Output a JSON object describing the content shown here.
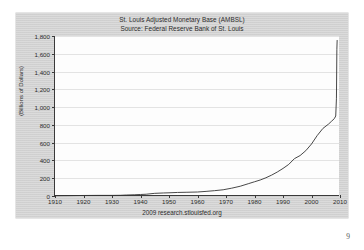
{
  "page": {
    "page_number": "9",
    "footer_note": "2009 research.stlouisfed.org"
  },
  "figure": {
    "title_line_1": "St. Louis Adjusted Monetary Base (AMBSL)",
    "title_line_2": "Source: Federal Reserve Bank of St. Louis",
    "y_axis_title": "(Billions of Dollars)",
    "line_color": "#333333",
    "grid_color": "#e3e3e3",
    "axis_color": "#3a3a3a",
    "card_color": "#d6d6d6",
    "plot_bg": "#fdfdfd"
  },
  "chart_data": {
    "type": "line",
    "title": "St. Louis Adjusted Monetary Base (AMBSL)",
    "subtitle": "Source: Federal Reserve Bank of St. Louis",
    "xlabel": "",
    "ylabel": "(Billions of Dollars)",
    "xlim": [
      1910,
      2010
    ],
    "ylim": [
      0,
      1800
    ],
    "xticks": [
      1910,
      1920,
      1930,
      1940,
      1950,
      1960,
      1970,
      1980,
      1990,
      2000,
      2010
    ],
    "yticks": [
      0,
      200,
      400,
      600,
      800,
      1000,
      1200,
      1400,
      1600,
      1800
    ],
    "ytick_labels": [
      "0",
      "200",
      "400",
      "600",
      "800",
      "1,000",
      "1,200",
      "1,400",
      "1,600",
      "1,800"
    ],
    "xtick_labels": [
      "1910",
      "1920",
      "1930",
      "1940",
      "1950",
      "1960",
      "1970",
      "1980",
      "1990",
      "2000",
      "2010"
    ],
    "grid": true,
    "legend": false,
    "series": [
      {
        "name": "AMBSL",
        "x": [
          1910,
          1915,
          1920,
          1925,
          1930,
          1933,
          1935,
          1938,
          1940,
          1942,
          1945,
          1948,
          1950,
          1953,
          1956,
          1960,
          1963,
          1966,
          1969,
          1972,
          1975,
          1978,
          1980,
          1982,
          1984,
          1986,
          1988,
          1990,
          1992,
          1994,
          1996,
          1998,
          2000,
          2002,
          2004,
          2006,
          2007,
          2008.0,
          2008.5,
          2008.75,
          2008.9,
          2009.0
        ],
        "y": [
          3,
          4,
          6,
          7,
          7,
          8,
          11,
          14,
          17,
          20,
          30,
          34,
          36,
          40,
          42,
          45,
          52,
          60,
          70,
          88,
          110,
          140,
          160,
          180,
          205,
          235,
          270,
          310,
          355,
          420,
          455,
          510,
          585,
          680,
          760,
          810,
          840,
          870,
          900,
          1100,
          1650,
          1750
        ]
      }
    ],
    "annotations": [
      "Sharp vertical spike in late 2008 from roughly 900 to over 1,700 billion dollars"
    ]
  }
}
